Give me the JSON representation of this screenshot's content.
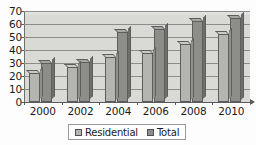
{
  "chart_data": {
    "type": "bar",
    "title": "",
    "subtitle": "",
    "xlabel": "",
    "ylabel": "",
    "categories": [
      "2000",
      "2002",
      "2004",
      "2006",
      "2008",
      "2010"
    ],
    "series": [
      {
        "name": "Residential",
        "color": "#b4b4b1",
        "values": [
          22,
          27,
          35,
          38,
          45,
          52
        ]
      },
      {
        "name": "Total",
        "color": "#8d8d8a",
        "values": [
          30,
          31,
          54,
          56,
          62,
          65
        ]
      }
    ],
    "ylim": [
      0,
      70
    ],
    "ytick_step": 10,
    "yticks": [
      "0",
      "10",
      "20",
      "30",
      "40",
      "50",
      "60",
      "70"
    ],
    "grid": "horizontal",
    "legend_position": "bottom",
    "legend": [
      "Residential",
      "Total"
    ],
    "style": "3d-clustered-column",
    "plot_background": "#d9d9d6"
  }
}
